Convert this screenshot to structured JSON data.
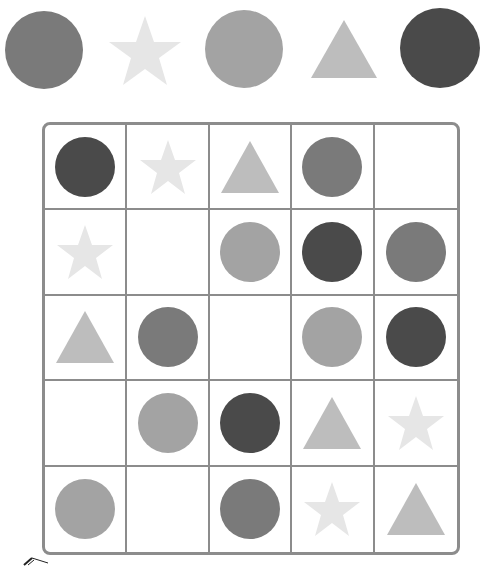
{
  "colors": {
    "circle_dark": "#4a4a4a",
    "circle_medium": "#7a7a7a",
    "circle_light": "#a3a3a3",
    "triangle": "#bdbdbd",
    "star": "#e6e6e6",
    "grid_border": "#8c8c8c"
  },
  "legend_row": [
    {
      "shape": "circle",
      "tone": "medium"
    },
    {
      "shape": "star",
      "tone": "star"
    },
    {
      "shape": "circle",
      "tone": "light"
    },
    {
      "shape": "triangle",
      "tone": "triangle"
    },
    {
      "shape": "circle",
      "tone": "dark"
    }
  ],
  "grid": {
    "rows": 5,
    "cols": 5,
    "cells": [
      [
        "circle-dark",
        "star",
        "triangle",
        "circle-medium",
        "empty"
      ],
      [
        "star",
        "empty",
        "circle-light",
        "circle-dark",
        "circle-medium"
      ],
      [
        "triangle",
        "circle-medium",
        "empty",
        "circle-light",
        "circle-dark"
      ],
      [
        "empty",
        "circle-light",
        "circle-dark",
        "triangle",
        "star"
      ],
      [
        "circle-light",
        "empty",
        "circle-medium",
        "star",
        "triangle"
      ]
    ]
  }
}
